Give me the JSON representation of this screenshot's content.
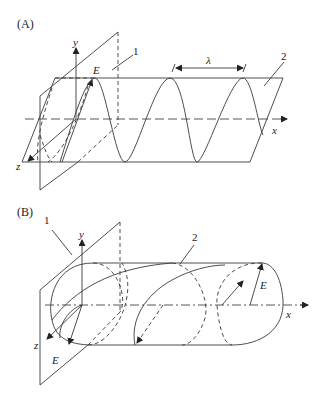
{
  "panels": {
    "a": {
      "label": "(A)",
      "axis_x": "x",
      "axis_y": "y",
      "axis_z": "z",
      "field": "E",
      "wavelength": "λ",
      "callout_1": "1",
      "callout_2": "2"
    },
    "b": {
      "label": "(B)",
      "axis_x": "x",
      "axis_y": "y",
      "axis_z": "z",
      "field_left": "E",
      "field_right": "E",
      "callout_1": "1",
      "callout_2": "2"
    }
  },
  "colors": {
    "line": "#3a3a3a",
    "background": "#ffffff"
  }
}
